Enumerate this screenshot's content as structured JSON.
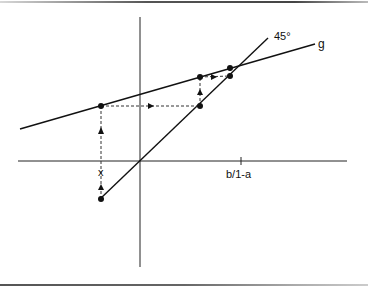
{
  "diagram": {
    "labels": {
      "line_45": "45°",
      "line_g": "g",
      "x_axis_tick": "b/1-a",
      "start_label": "x"
    },
    "colors": {
      "line": "#111111",
      "background": "#ffffff"
    },
    "axes": {
      "vertical": {
        "x": 140,
        "y1": 17,
        "y2": 267
      },
      "horizontal": {
        "y": 161,
        "x1": 18,
        "x2": 347
      },
      "tick_x": 241
    },
    "lines": {
      "g": {
        "x1": 20,
        "y1": 129,
        "x2": 315,
        "y2": 44
      },
      "deg45": {
        "x1": 100,
        "y1": 199,
        "x2": 268,
        "y2": 38
      }
    },
    "points": [
      {
        "x": 101,
        "y": 199
      },
      {
        "x": 101,
        "y": 106
      },
      {
        "x": 200,
        "y": 106
      },
      {
        "x": 200,
        "y": 77
      },
      {
        "x": 230,
        "y": 76
      },
      {
        "x": 230,
        "y": 68
      }
    ]
  }
}
